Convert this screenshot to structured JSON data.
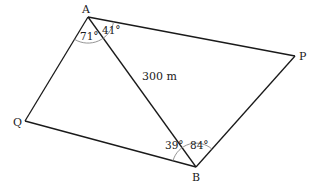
{
  "diagram": {
    "points": {
      "A": {
        "label": "A",
        "x": 88,
        "y": 17
      },
      "P": {
        "label": "P",
        "x": 295,
        "y": 56
      },
      "B": {
        "label": "B",
        "x": 196,
        "y": 167
      },
      "Q": {
        "label": "Q",
        "x": 25,
        "y": 121
      }
    },
    "segments": [
      {
        "from": "A",
        "to": "P"
      },
      {
        "from": "P",
        "to": "B"
      },
      {
        "from": "B",
        "to": "Q"
      },
      {
        "from": "Q",
        "to": "A"
      },
      {
        "from": "A",
        "to": "B",
        "label": "300 m"
      }
    ],
    "angles": {
      "A_left": "71°",
      "A_right": "41°",
      "B_left": "39°",
      "B_right": "84°"
    },
    "length_label": "300 m",
    "line_color": "#1a1a1a",
    "arc_color": "#888888"
  }
}
